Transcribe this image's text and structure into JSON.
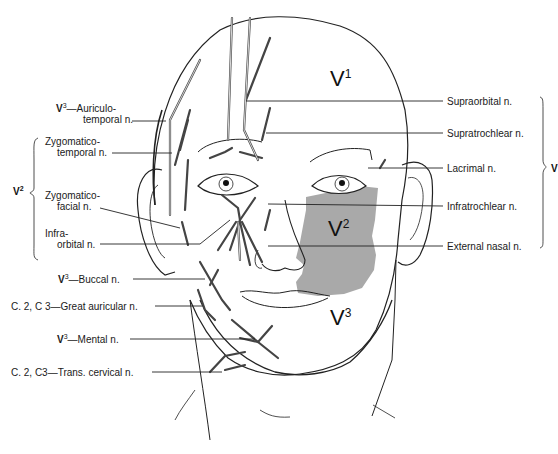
{
  "figure": {
    "shaded_region_color": "#a9a9a9",
    "line_color": "#222222",
    "zones": [
      {
        "id": "V1",
        "base": "V",
        "sup": "1"
      },
      {
        "id": "V2",
        "base": "V",
        "sup": "2"
      },
      {
        "id": "V3",
        "base": "V",
        "sup": "3"
      }
    ]
  },
  "left_labels": {
    "auriculotemporal": {
      "prefix": "V",
      "prefix_sup": "3",
      "line1": "—Auriculo-",
      "line2": "temporal n."
    },
    "v2_group": {
      "brace_label": {
        "base": "V",
        "sup": "2"
      },
      "zygomaticotemporal": {
        "line1": "Zygomatico-",
        "line2": "temporal n."
      },
      "zygomaticofacial": {
        "line1": "Zygomatico-",
        "line2": "facial n."
      },
      "infraorbital": {
        "line1": "Infra-",
        "line2": "orbital n."
      }
    },
    "buccal": {
      "prefix": "V",
      "prefix_sup": "3",
      "text": "—Buccal n."
    },
    "great_auricular": {
      "text": "C. 2, C 3—Great auricular n."
    },
    "mental": {
      "prefix": "V",
      "prefix_sup": "3",
      "text": "—Mental n."
    },
    "trans_cervical": {
      "text": "C. 2, C3—Trans. cervical n."
    }
  },
  "right_labels": {
    "items": [
      "Supraorbital n.",
      "Supratrochlear n.",
      "Lacrimal n.",
      "Infratrochlear n.",
      "External nasal n."
    ],
    "brace_label": {
      "base": "V",
      "sup": ""
    }
  }
}
